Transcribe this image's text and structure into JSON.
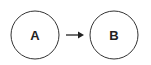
{
  "diagram": {
    "nodes": [
      {
        "id": "A",
        "label": "A",
        "cx": 35,
        "cy": 35,
        "r": 24
      },
      {
        "id": "B",
        "label": "B",
        "cx": 114,
        "cy": 35,
        "r": 24
      }
    ],
    "edges": [
      {
        "from": "A",
        "to": "B",
        "x1": 66,
        "x2": 83,
        "y": 35
      }
    ],
    "colors": {
      "stroke": "#333333",
      "text": "#222222",
      "background": "#ffffff"
    }
  }
}
